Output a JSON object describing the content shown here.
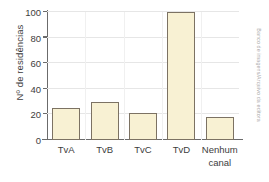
{
  "chart_data": {
    "type": "bar",
    "title": "",
    "xlabel": "",
    "ylabel": "Nº de residências",
    "categories": [
      "TvA",
      "TvB",
      "TvC",
      "TvD",
      "Nenhum canal"
    ],
    "values": [
      25,
      30,
      21,
      100,
      18
    ],
    "ylim": [
      0,
      100
    ],
    "yticks": [
      0,
      20,
      40,
      60,
      80,
      100
    ],
    "ytick_labels": [
      "0",
      "20",
      "40",
      "60",
      "80",
      "100"
    ],
    "grid": true,
    "legend": false,
    "legend_position": "none",
    "bar_fill_color": "#f8f1d3",
    "bar_border_color": "#7c7263",
    "gridline_color": "#e6e6e6",
    "axis_color": "#6b6b6b",
    "text_color": "#3d3d3d",
    "background_color": "#ffffff"
  },
  "credit": {
    "text": "Banco de imagens/Arquivo da editora",
    "color": "#a9a9a9"
  },
  "category_labels": [
    {
      "line1": "TvA",
      "line2": ""
    },
    {
      "line1": "TvB",
      "line2": ""
    },
    {
      "line1": "TvC",
      "line2": ""
    },
    {
      "line1": "TvD",
      "line2": ""
    },
    {
      "line1": "Nenhum",
      "line2": "canal"
    }
  ]
}
